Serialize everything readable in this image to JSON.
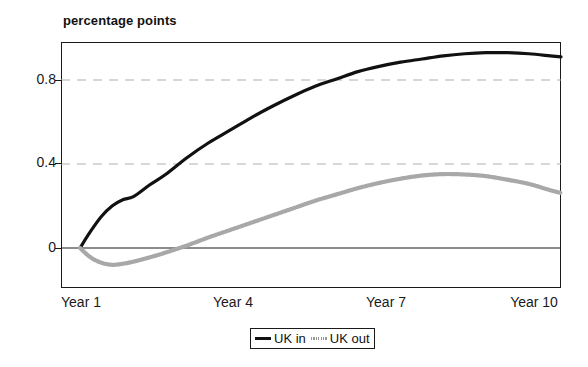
{
  "chart_data": {
    "type": "line",
    "title": "percentage points",
    "xlabel": "",
    "ylabel": "percentage points",
    "grid": true,
    "legend_position": "bottom-center",
    "xlim": [
      1,
      10
    ],
    "ylim": [
      -0.12,
      1.0
    ],
    "x_tick_labels": [
      "Year 1",
      "Year 4",
      "Year 7",
      "Year 10"
    ],
    "x_tick_values": [
      1,
      4,
      7,
      10
    ],
    "y_tick_labels": [
      "0.8",
      "0.4",
      "0"
    ],
    "y_tick_values": [
      0.8,
      0.4,
      0
    ],
    "gridline_values": [
      0.8,
      0.4
    ],
    "zero_line_value": 0,
    "x": [
      1.0,
      1.2,
      1.4,
      1.6,
      1.8,
      2.0,
      2.3,
      2.6,
      3.0,
      3.4,
      3.8,
      4.2,
      4.6,
      5.0,
      5.4,
      5.8,
      6.2,
      6.6,
      7.0,
      7.4,
      7.8,
      8.2,
      8.6,
      9.0,
      9.4,
      9.8,
      10.0
    ],
    "series": [
      {
        "name": "UK in",
        "color": "#111111",
        "style": "solid",
        "values": [
          0.0,
          0.08,
          0.15,
          0.2,
          0.23,
          0.245,
          0.3,
          0.35,
          0.43,
          0.5,
          0.56,
          0.62,
          0.675,
          0.725,
          0.77,
          0.805,
          0.84,
          0.865,
          0.885,
          0.9,
          0.915,
          0.925,
          0.93,
          0.93,
          0.925,
          0.915,
          0.91
        ]
      },
      {
        "name": "UK out",
        "color": "#a8a8a8",
        "style": "dotted",
        "values": [
          0.0,
          -0.045,
          -0.07,
          -0.08,
          -0.075,
          -0.065,
          -0.045,
          -0.022,
          0.012,
          0.05,
          0.085,
          0.12,
          0.155,
          0.19,
          0.225,
          0.255,
          0.285,
          0.31,
          0.33,
          0.345,
          0.352,
          0.35,
          0.342,
          0.325,
          0.305,
          0.275,
          0.262
        ]
      }
    ],
    "legend": [
      {
        "label": "UK in",
        "swatch": "solid-black-line"
      },
      {
        "label": "UK out",
        "swatch": "dotted-gray-line"
      }
    ]
  },
  "colors": {
    "uk_in": "#111111",
    "uk_out": "#a8a8a8",
    "axis": "#1a1a1a",
    "gridline": "#b0b0b0",
    "background": "#ffffff"
  }
}
